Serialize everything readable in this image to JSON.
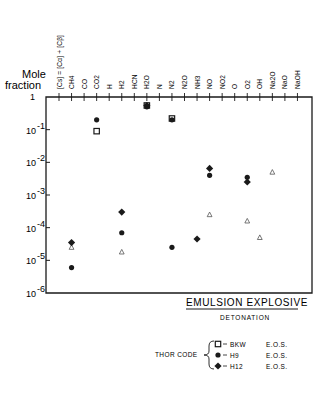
{
  "chart_data": {
    "type": "scatter",
    "title": "Mole fraction",
    "ylabel": "Mole fraction",
    "yscale": "log",
    "ylim": [
      1e-06,
      1
    ],
    "y_ticks": [
      "1",
      "10-1",
      "10-2",
      "10-3",
      "10-4",
      "10-5",
      "10-6"
    ],
    "categories": [
      "[Cs] = [Cα] + [Cβ]",
      "CH4",
      "CO",
      "CO2",
      "H",
      "H2",
      "HCN",
      "H2O",
      "N",
      "N2",
      "N2O",
      "NH3",
      "NO",
      "NO2",
      "O",
      "O2",
      "OH",
      "Na2O",
      "NaO",
      "NaOH"
    ],
    "series": [
      {
        "name": "BKW E.O.S.",
        "marker": "open-square",
        "points": [
          {
            "x": "CO2",
            "y": 0.09
          },
          {
            "x": "H2O",
            "y": 0.55
          },
          {
            "x": "N2",
            "y": 0.22
          }
        ]
      },
      {
        "name": "H9 E.O.S.",
        "marker": "filled-circle",
        "points": [
          {
            "x": "CH4",
            "y": 6e-06
          },
          {
            "x": "CO2",
            "y": 0.2
          },
          {
            "x": "H2",
            "y": 7e-05
          },
          {
            "x": "H2O",
            "y": 0.5
          },
          {
            "x": "N2",
            "y": 0.2
          },
          {
            "x": "N2",
            "y": 2.5e-05
          },
          {
            "x": "NO",
            "y": 0.004
          },
          {
            "x": "O2",
            "y": 0.0035
          }
        ]
      },
      {
        "name": "H12 E.O.S.",
        "marker": "filled-diamond",
        "points": [
          {
            "x": "CH4",
            "y": 3.5e-05
          },
          {
            "x": "H2",
            "y": 0.0003
          },
          {
            "x": "H2O",
            "y": 0.55
          },
          {
            "x": "NH3",
            "y": 4.5e-05
          },
          {
            "x": "NO",
            "y": 0.0065
          },
          {
            "x": "O2",
            "y": 0.0025
          }
        ]
      },
      {
        "name": "open triangle (unlabeled)",
        "marker": "open-triangle",
        "points": [
          {
            "x": "CH4",
            "y": 2.5e-05
          },
          {
            "x": "H2",
            "y": 1.8e-05
          },
          {
            "x": "NO",
            "y": 0.00025
          },
          {
            "x": "O2",
            "y": 0.00016
          },
          {
            "x": "OH",
            "y": 5e-05
          },
          {
            "x": "Na2O",
            "y": 0.005
          }
        ]
      }
    ],
    "annotations": [
      "EMULSION EXPLOSIVE",
      "DETONATION"
    ],
    "legend": {
      "group_label": "THOR CODE",
      "entries": [
        {
          "marker": "open-square",
          "code": "BKW",
          "eos": "E.O.S."
        },
        {
          "marker": "filled-circle",
          "code": "H9",
          "eos": "E.O.S."
        },
        {
          "marker": "filled-diamond",
          "code": "H12",
          "eos": "E.O.S."
        }
      ],
      "position": "bottom-center"
    },
    "grid": false
  },
  "labels": {
    "title_line1": "Mole",
    "title_line2": "fraction",
    "caption": "EMULSION EXPLOSIVE",
    "subcaption": "DETONATION",
    "legend_group": "THOR CODE"
  }
}
